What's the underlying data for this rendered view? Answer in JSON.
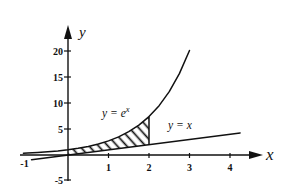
{
  "chart_data": {
    "type": "line",
    "title": "",
    "xlabel": "x",
    "ylabel": "y",
    "xlim": [
      -1.15,
      4.5
    ],
    "ylim": [
      -5,
      22
    ],
    "grid": false,
    "legend": null,
    "x_ticks": [
      -1,
      1,
      2,
      3,
      4
    ],
    "x_tick_labels": [
      "-1",
      "1",
      "2",
      "3",
      "4"
    ],
    "y_ticks": [
      -5,
      5,
      10,
      15,
      20
    ],
    "y_tick_labels": [
      "-5",
      "5",
      "10",
      "15",
      "20"
    ],
    "series": [
      {
        "id": "exp",
        "name": "y = e^x",
        "x": [
          -1.1,
          -1,
          -0.75,
          -0.5,
          -0.25,
          0,
          0.25,
          0.5,
          0.75,
          1,
          1.25,
          1.5,
          1.75,
          2,
          2.25,
          2.5,
          2.75,
          3
        ],
        "y": [
          0.33,
          0.37,
          0.47,
          0.61,
          0.78,
          1,
          1.28,
          1.65,
          2.12,
          2.72,
          3.49,
          4.48,
          5.75,
          7.39,
          9.49,
          12.18,
          15.64,
          20.09
        ]
      },
      {
        "id": "identity",
        "name": "y = x",
        "x": [
          -0.9,
          4.25
        ],
        "y": [
          -0.9,
          4.25
        ]
      }
    ],
    "shaded_region": {
      "upper": "exp",
      "lower": "identity",
      "x_range": [
        0,
        2
      ],
      "pattern": "diagonal-hatch",
      "right_boundary_x": 2
    },
    "annotations": [
      {
        "text": "y = e^x",
        "x": 0.84,
        "y": 7.4
      },
      {
        "text": "y = x",
        "x": 2.47,
        "y": 5.0
      }
    ]
  }
}
